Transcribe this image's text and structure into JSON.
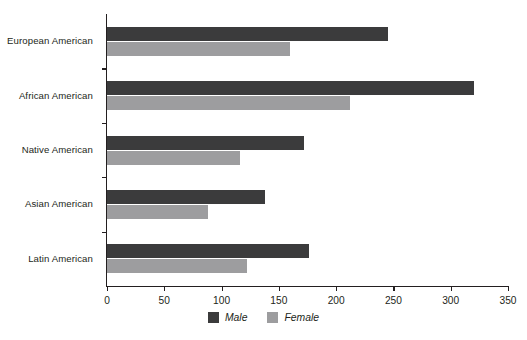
{
  "chart_data": {
    "type": "bar",
    "orientation": "horizontal",
    "title": "",
    "xlabel": "",
    "ylabel": "",
    "categories": [
      "European American",
      "African American",
      "Native American",
      "Asian American",
      "Latin American"
    ],
    "series": [
      {
        "name": "Male",
        "color": "#3b3b3c",
        "values": [
          245,
          320,
          172,
          138,
          176
        ]
      },
      {
        "name": "Female",
        "color": "#9d9d9f",
        "values": [
          160,
          212,
          116,
          88,
          122
        ]
      }
    ],
    "xlim": [
      0,
      350
    ],
    "xticks": [
      0,
      50,
      100,
      150,
      200,
      250,
      300,
      350
    ],
    "xtick_labels": [
      "0",
      "50",
      "100",
      "150",
      "200",
      "250",
      "300",
      "350"
    ],
    "grid": false,
    "legend_position": "bottom-center",
    "legend_entries": [
      "Male",
      "Female"
    ]
  }
}
